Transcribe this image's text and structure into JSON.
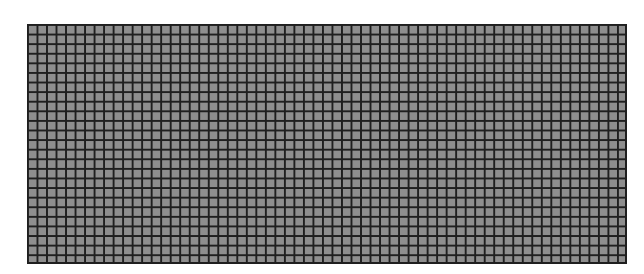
{
  "grid": {
    "columns": 63,
    "rows": 25,
    "cell_color": "#8e8e8e",
    "line_color": "#1f1f1f"
  }
}
